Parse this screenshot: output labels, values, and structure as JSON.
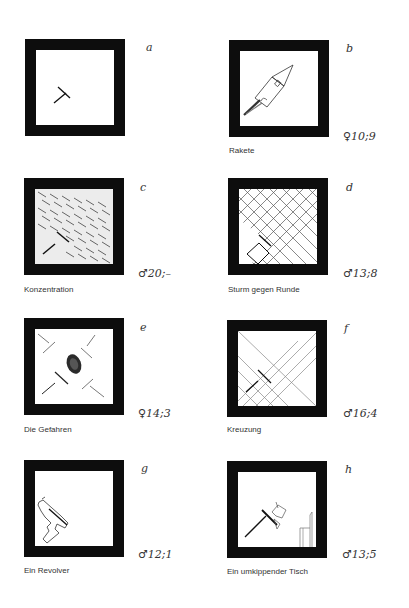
{
  "figure": {
    "panels": [
      {
        "id": "a",
        "letter": "a",
        "sex_age": "",
        "caption": ""
      },
      {
        "id": "b",
        "letter": "b",
        "sex_age": "♀10;9",
        "caption": "Rakete"
      },
      {
        "id": "c",
        "letter": "c",
        "sex_age": "♂20;–",
        "caption": "Konzentration"
      },
      {
        "id": "d",
        "letter": "d",
        "sex_age": "♂13;8",
        "caption": "Sturm gegen Runde"
      },
      {
        "id": "e",
        "letter": "e",
        "sex_age": "♀14;3",
        "caption": "Die Gefahren"
      },
      {
        "id": "f",
        "letter": "f",
        "sex_age": "♂16;4",
        "caption": "Kreuzung"
      },
      {
        "id": "g",
        "letter": "g",
        "sex_age": "♂12;1",
        "caption": "Ein Revolver"
      },
      {
        "id": "h",
        "letter": "h",
        "sex_age": "♂13;5",
        "caption": "Ein umkippender Tisch"
      }
    ]
  }
}
